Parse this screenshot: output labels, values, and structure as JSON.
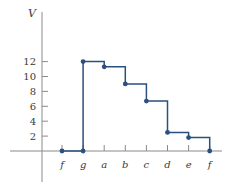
{
  "chart_data": {
    "type": "line",
    "subtype": "step",
    "title": "",
    "xlabel": "",
    "ylabel": "V",
    "categories": [
      "f",
      "g",
      "a",
      "b",
      "c",
      "d",
      "e",
      "f"
    ],
    "yticks": [
      2,
      4,
      6,
      8,
      10,
      12
    ],
    "ylim": [
      0,
      13
    ],
    "grid": false,
    "legend": null,
    "series": [
      {
        "name": "V",
        "points": [
          {
            "x": "f",
            "y": 0
          },
          {
            "x": "g",
            "y": 0
          },
          {
            "x": "g",
            "y": 12
          },
          {
            "x": "a",
            "y": 11.3
          },
          {
            "x": "b",
            "y": 9
          },
          {
            "x": "c",
            "y": 6.7
          },
          {
            "x": "d",
            "y": 2.5
          },
          {
            "x": "e",
            "y": 1.8
          },
          {
            "x": "f",
            "y": 0
          }
        ],
        "step_levels": [
          {
            "from": "f",
            "to": "g",
            "value": 0
          },
          {
            "from": "g",
            "to": "a",
            "value": 12
          },
          {
            "from": "a",
            "to": "b",
            "value": 11.3
          },
          {
            "from": "b",
            "to": "c",
            "value": 9
          },
          {
            "from": "c",
            "to": "d",
            "value": 6.7
          },
          {
            "from": "d",
            "to": "e",
            "value": 2.5
          },
          {
            "from": "e",
            "to": "f",
            "value": 1.8
          }
        ],
        "color": "#2b4f7e"
      }
    ]
  },
  "colors": {
    "series": "#2b4f7e",
    "axis": "#8a8a8a",
    "text": "#3a3a3a"
  }
}
